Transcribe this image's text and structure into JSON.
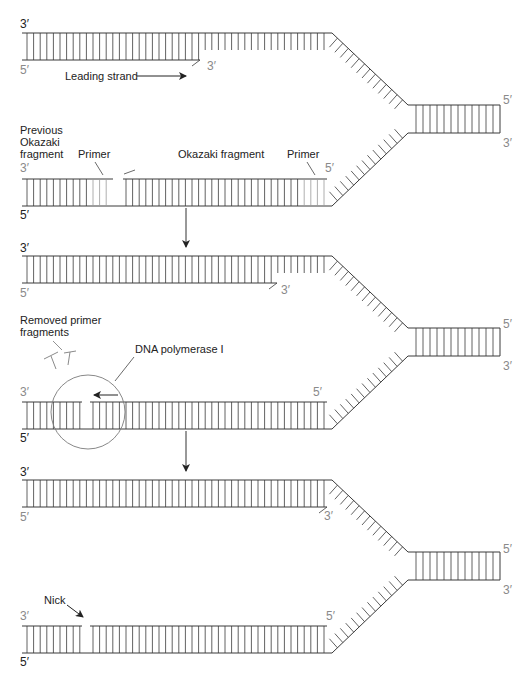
{
  "colors": {
    "strand": "#3a3a3a",
    "primer": "#9a9a9a",
    "circle": "#7a7a7a",
    "gray_label": "#8a8a8a",
    "text": "#222222",
    "background": "#ffffff"
  },
  "labels": {
    "three_prime": "3′",
    "five_prime": "5′",
    "leading_strand": "Leading strand",
    "previous_okazaki_line1": "Previous",
    "previous_okazaki_line2": "Okazaki",
    "previous_okazaki_line3": "fragment",
    "primer_left": "Primer",
    "okazaki_fragment": "Okazaki fragment",
    "primer_right": "Primer",
    "removed_primer_line1": "Removed primer",
    "removed_primer_line2": "fragments",
    "dna_polymerase": "DNA polymerase I",
    "nick": "Nick"
  },
  "panels": [
    {
      "id": "panel-1-primers-present",
      "top_y": 33,
      "leading_end_x": 200,
      "lagging_gap": [
        113,
        123
      ],
      "primer_ranges": [
        [
          88,
          113
        ],
        [
          300,
          330
        ]
      ]
    },
    {
      "id": "panel-2-primer-removal",
      "top_y": 256,
      "leading_end_x": 277,
      "lagging_gap": [
        82,
        90
      ],
      "primer_ranges": []
    },
    {
      "id": "panel-3-nick",
      "top_y": 480,
      "leading_end_x": 327,
      "lagging_gap": [
        82,
        90
      ],
      "primer_ranges": []
    }
  ]
}
